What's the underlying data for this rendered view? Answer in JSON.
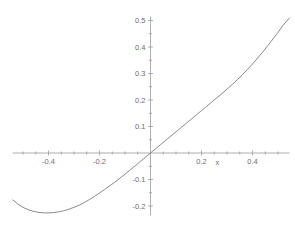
{
  "chart_data": {
    "type": "line",
    "title": "",
    "subtitle": "",
    "xlabel": "x",
    "ylabel": "",
    "xlim": [
      -0.54,
      0.545
    ],
    "ylim": [
      -0.235,
      0.515
    ],
    "grid": false,
    "legend": null,
    "xticks": [
      -0.4,
      -0.2,
      0.2,
      0.4
    ],
    "xtick_labels": [
      "-0.4",
      "-0.2",
      "0.2",
      "0.4"
    ],
    "yticks": [
      0.5,
      0.4,
      0.3,
      0.2,
      0.1,
      -0.1,
      -0.2
    ],
    "ytick_labels": [
      "0.5",
      "0.4",
      "0.3",
      "0.2",
      "0.1",
      "-0.1",
      "-0.2"
    ],
    "x_minor_ticks": [
      -0.5,
      -0.45,
      -0.35,
      -0.3,
      -0.25,
      -0.15,
      -0.1,
      -0.05,
      0.05,
      0.1,
      0.15,
      0.25,
      0.3,
      0.35,
      0.45,
      0.5
    ],
    "y_minor_ticks": [
      0.45,
      0.35,
      0.25,
      0.15,
      0.05,
      -0.05,
      -0.15
    ],
    "series": [
      {
        "name": "curve",
        "color": "#7d7d7d",
        "x": [
          -0.54,
          -0.52,
          -0.5,
          -0.48,
          -0.46,
          -0.44,
          -0.42,
          -0.4,
          -0.38,
          -0.36,
          -0.34,
          -0.32,
          -0.3,
          -0.28,
          -0.26,
          -0.24,
          -0.22,
          -0.2,
          -0.18,
          -0.16,
          -0.14,
          -0.12,
          -0.1,
          -0.08,
          -0.06,
          -0.04,
          -0.02,
          0.0,
          0.02,
          0.04,
          0.06,
          0.08,
          0.1,
          0.12,
          0.14,
          0.16,
          0.18,
          0.2,
          0.22,
          0.24,
          0.26,
          0.28,
          0.3,
          0.32,
          0.34,
          0.36,
          0.38,
          0.4,
          0.42,
          0.44,
          0.46,
          0.48,
          0.5,
          0.52,
          0.545
        ],
        "y": [
          -0.177,
          -0.193,
          -0.205,
          -0.214,
          -0.22,
          -0.224,
          -0.226,
          -0.226,
          -0.225,
          -0.222,
          -0.218,
          -0.212,
          -0.205,
          -0.197,
          -0.187,
          -0.176,
          -0.164,
          -0.151,
          -0.138,
          -0.124,
          -0.11,
          -0.095,
          -0.08,
          -0.064,
          -0.048,
          -0.032,
          -0.016,
          0.0,
          0.016,
          0.032,
          0.048,
          0.064,
          0.08,
          0.096,
          0.112,
          0.128,
          0.144,
          0.16,
          0.176,
          0.192,
          0.208,
          0.224,
          0.241,
          0.258,
          0.276,
          0.295,
          0.315,
          0.336,
          0.358,
          0.381,
          0.405,
          0.43,
          0.455,
          0.482,
          0.51
        ]
      }
    ]
  },
  "axes": {
    "x_axis_name": "x"
  }
}
